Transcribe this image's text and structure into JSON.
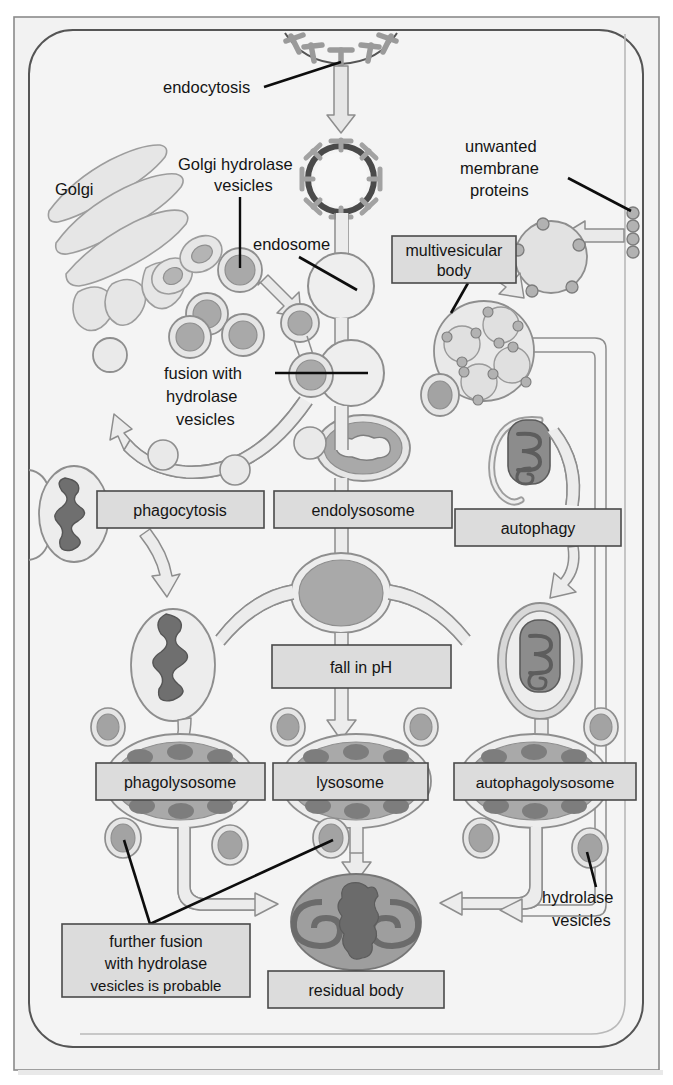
{
  "figure": {
    "domain": "cell-biology-diagram",
    "width": 673,
    "height": 1085
  },
  "colors": {
    "page_background": "#ffffff",
    "outer_frame_fill": "#f2f2f2",
    "outer_frame_stroke": "#767676",
    "cell_fill": "#f4f4f4",
    "cell_membrane_stroke": "#4e4e4e",
    "organelle_light": "#e3e3e3",
    "organelle_mid": "#c3c3c3",
    "organelle_dark": "#9a9a9a",
    "organelle_darker": "#7d7d7d",
    "cargo_dark": "#6f6f6f",
    "box_fill": "#dcdcdc",
    "box_stroke": "#4a4a4a",
    "arrow_fill": "#e6e6e6",
    "arrow_stroke": "#8a8a8a",
    "leader_line": "#0d0d0d",
    "text": "#141414"
  },
  "labels": {
    "endocytosis": "endocytosis",
    "golgi": "Golgi",
    "golgi_hydrolase_vesicles_line1": "Golgi hydrolase",
    "golgi_hydrolase_vesicles_line2": "vesicles",
    "endosome": "endosome",
    "unwanted_membrane_proteins_line1": "unwanted",
    "unwanted_membrane_proteins_line2": "membrane",
    "unwanted_membrane_proteins_line3": "proteins",
    "multivesicular_body_line1": "multivesicular",
    "multivesicular_body_line2": "body",
    "fusion_with_hydrolase_vesicles_line1": "fusion with",
    "fusion_with_hydrolase_vesicles_line2": "hydrolase",
    "fusion_with_hydrolase_vesicles_line3": "vesicles",
    "phagocytosis": "phagocytosis",
    "endolysosome": "endolysosome",
    "autophagy": "autophagy",
    "fall_in_ph": "fall in pH",
    "phagolysosome": "phagolysosome",
    "lysosome": "lysosome",
    "autophagolysosome": "autophagolysosome",
    "hydrolase_vesicles_line1": "hydrolase",
    "hydrolase_vesicles_line2": "vesicles",
    "further_fusion_line1": "further fusion",
    "further_fusion_line2": "with hydrolase",
    "further_fusion_line3": "vesicles is probable",
    "residual_body": "residual body"
  },
  "boxes": [
    {
      "name": "multivesicular-body",
      "text_lines": [
        "multivesicular",
        "body"
      ],
      "x": 392,
      "y": 236,
      "w": 124,
      "h": 47
    },
    {
      "name": "phagocytosis",
      "text": "phagocytosis",
      "x": 97,
      "y": 491,
      "w": 167,
      "h": 37
    },
    {
      "name": "endolysosome",
      "text": "endolysosome",
      "x": 274,
      "y": 491,
      "w": 178,
      "h": 37
    },
    {
      "name": "autophagy",
      "text": "autophagy",
      "x": 455,
      "y": 509,
      "w": 166,
      "h": 37
    },
    {
      "name": "fall-in-ph",
      "text": "fall in pH",
      "x": 272,
      "y": 645,
      "w": 179,
      "h": 43
    },
    {
      "name": "phagolysosome",
      "text": "phagolysosome",
      "x": 96,
      "y": 763,
      "w": 169,
      "h": 37
    },
    {
      "name": "lysosome",
      "text": "lysosome",
      "x": 273,
      "y": 763,
      "w": 155,
      "h": 37
    },
    {
      "name": "autophagolysosome",
      "text": "autophagolysosome",
      "x": 454,
      "y": 763,
      "w": 182,
      "h": 37
    },
    {
      "name": "further-fusion",
      "text_lines": [
        "further fusion",
        "with hydrolase",
        "vesicles is probable"
      ],
      "x": 62,
      "y": 924,
      "w": 188,
      "h": 73
    },
    {
      "name": "residual-body",
      "text": "residual body",
      "x": 268,
      "y": 971,
      "w": 176,
      "h": 37
    }
  ],
  "pathways": {
    "endocytic": [
      "endocytosis",
      "endosome",
      "fusion with hydrolase vesicles",
      "endolysosome",
      "fall in pH",
      "lysosome",
      "residual body"
    ],
    "phagocytic": [
      "phagocytosis",
      "phagolysosome",
      "residual body"
    ],
    "autophagic": [
      "autophagy",
      "autophagolysosome",
      "residual body"
    ],
    "membrane_protein": [
      "unwanted membrane proteins",
      "multivesicular body"
    ]
  }
}
